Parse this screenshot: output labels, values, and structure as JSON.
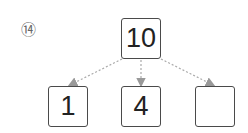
{
  "problem_number": "⑭",
  "tree": {
    "root": {
      "value": "10"
    },
    "children": [
      {
        "value": "1"
      },
      {
        "value": "4"
      },
      {
        "value": ""
      }
    ]
  },
  "colors": {
    "box_border": "#4a4a4a",
    "arrow": "#999999",
    "text": "#222222"
  }
}
